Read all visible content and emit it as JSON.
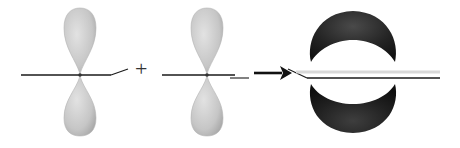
{
  "diagram": {
    "operator": "+",
    "colors": {
      "p_orbital_fill": "#c8c8c8",
      "p_orbital_edge": "#b4b4b4",
      "pi_bond_fill": "#2a2a2a",
      "bond_line": "#1a1a1a",
      "background": "#ffffff"
    },
    "elements": [
      {
        "name": "p-orbital-left",
        "type": "p-orbital",
        "center_x": 80,
        "center_y": 75
      },
      {
        "name": "p-orbital-right",
        "type": "p-orbital",
        "center_x": 207,
        "center_y": 75
      },
      {
        "name": "reaction-arrow",
        "type": "arrow",
        "from_x": 254,
        "to_x": 289,
        "y": 72
      },
      {
        "name": "pi-bond",
        "type": "pi-bond",
        "center_x": 353,
        "center_y": 72
      }
    ]
  }
}
